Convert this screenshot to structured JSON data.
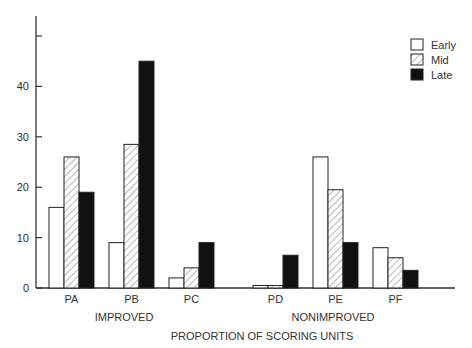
{
  "chart_data": {
    "type": "bar",
    "title": "",
    "xlabel": "PROPORTION OF SCORING UNITS",
    "ylabel": "",
    "ylim": [
      0,
      50
    ],
    "yticks": [
      0,
      10,
      20,
      30,
      40
    ],
    "ytick_labels": [
      "0",
      "10",
      "20",
      "30",
      "40"
    ],
    "grid": false,
    "legend_position": "top-right",
    "categories": [
      "PA",
      "PB",
      "PC",
      "PD",
      "PE",
      "PF"
    ],
    "groups": [
      {
        "label": "IMPROVED",
        "categories": [
          "PA",
          "PB",
          "PC"
        ]
      },
      {
        "label": "NONIMPROVED",
        "categories": [
          "PD",
          "PE",
          "PF"
        ]
      }
    ],
    "series": [
      {
        "name": "Early",
        "fill": "white",
        "values": [
          16,
          9,
          2,
          0.5,
          26,
          8
        ]
      },
      {
        "name": "Mid",
        "fill": "hatched",
        "values": [
          26,
          28.5,
          4,
          0.5,
          19.5,
          6
        ]
      },
      {
        "name": "Late",
        "fill": "black",
        "values": [
          19,
          45,
          9,
          6.5,
          9,
          3.5
        ]
      }
    ]
  },
  "colors": {
    "axis": "#333333",
    "early": "#ffffff",
    "late": "#111111",
    "hatch": "#888888"
  }
}
